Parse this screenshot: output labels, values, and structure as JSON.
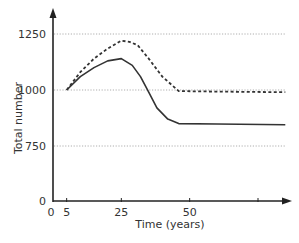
{
  "chart_data": {
    "type": "line",
    "title": "",
    "xlabel": "Time (years)",
    "ylabel": "Total number",
    "x_ticks": [
      {
        "value": 0,
        "label": "0"
      },
      {
        "value": 5,
        "label": "5"
      },
      {
        "value": 25,
        "label": "25"
      },
      {
        "value": 50,
        "label": "50"
      },
      {
        "value": 75,
        "label": ""
      }
    ],
    "y_ticks": [
      {
        "value": 0,
        "label": "0"
      },
      {
        "value": 750,
        "label": "750"
      },
      {
        "value": 1000,
        "label": "1000"
      },
      {
        "value": 1250,
        "label": "1250"
      }
    ],
    "gridlines_at": [
      750,
      1000,
      1250
    ],
    "grid": true,
    "xlim": [
      0,
      85
    ],
    "ylim": [
      0,
      1350
    ],
    "y_axis_break": "scale compressed between 0 and 750",
    "series": [
      {
        "name": "dashed",
        "style": "dashed",
        "x": [
          5,
          10,
          15,
          20,
          25,
          28,
          31,
          35,
          40,
          46,
          60,
          85
        ],
        "y": [
          1000,
          1080,
          1140,
          1185,
          1220,
          1215,
          1200,
          1140,
          1060,
          995,
          993,
          990
        ]
      },
      {
        "name": "solid",
        "style": "solid",
        "x": [
          5,
          10,
          15,
          20,
          25,
          29,
          32,
          35,
          38,
          42,
          46,
          60,
          85
        ],
        "y": [
          1000,
          1060,
          1100,
          1130,
          1140,
          1110,
          1060,
          990,
          920,
          870,
          850,
          848,
          845
        ]
      }
    ],
    "legend": "none"
  }
}
